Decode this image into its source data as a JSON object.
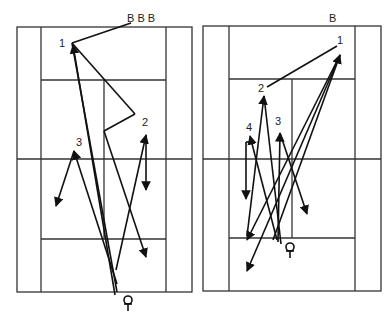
{
  "diagram": {
    "type": "badminton-court-shot-diagrams",
    "colors": {
      "lines": "#333333",
      "shots": "#111111",
      "background": "#ffffff"
    },
    "left_court": {
      "top_label": "B B B",
      "shot_labels": [
        "1",
        "2",
        "3"
      ],
      "player_icon": "player-icon"
    },
    "right_court": {
      "top_label": "B",
      "shot_labels": [
        "1",
        "2",
        "3",
        "4"
      ],
      "player_icon": "player-icon"
    }
  }
}
